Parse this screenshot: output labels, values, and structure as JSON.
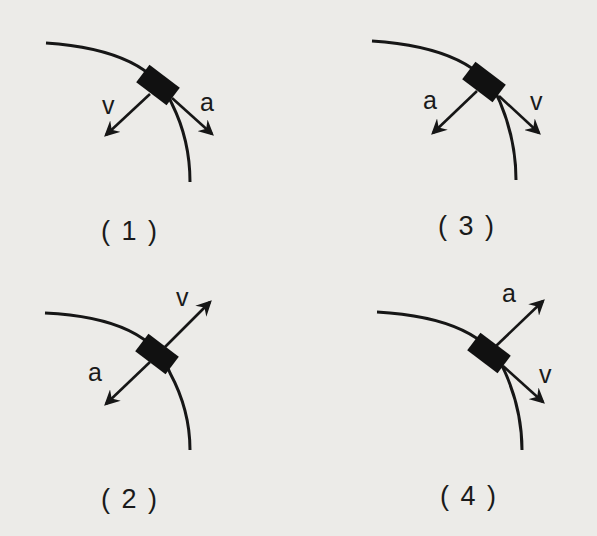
{
  "diagram": {
    "panels": [
      {
        "id": 1,
        "caption": "( 1 )",
        "velocity_label": "v",
        "acceleration_label": "a",
        "velocity_direction": "down-left (toward inside of curve)",
        "acceleration_direction": "down-right (along tangent)"
      },
      {
        "id": 2,
        "caption": "( 2 )",
        "velocity_label": "v",
        "acceleration_label": "a",
        "velocity_direction": "up-right (outward normal)",
        "acceleration_direction": "down-left (toward inside of curve)"
      },
      {
        "id": 3,
        "caption": "( 3 )",
        "velocity_label": "v",
        "acceleration_label": "a",
        "velocity_direction": "down-right (along tangent)",
        "acceleration_direction": "down-left (toward inside of curve)"
      },
      {
        "id": 4,
        "caption": "( 4 )",
        "velocity_label": "v",
        "acceleration_label": "a",
        "velocity_direction": "down-right (along tangent)",
        "acceleration_direction": "up-right (outward normal)"
      }
    ]
  }
}
